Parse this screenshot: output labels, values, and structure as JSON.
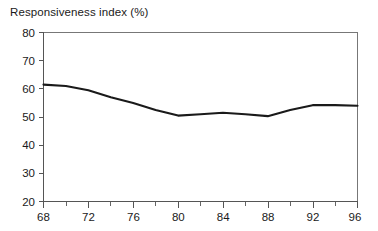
{
  "chart_data": {
    "type": "line",
    "title": "Responsiveness index (%)",
    "xlabel": "",
    "ylabel": "",
    "x": [
      68,
      70,
      72,
      74,
      76,
      78,
      80,
      82,
      84,
      86,
      88,
      90,
      92,
      94,
      96
    ],
    "values": [
      61.5,
      61,
      59.5,
      57,
      55,
      52.5,
      50.5,
      51,
      51.5,
      51,
      50.3,
      52.5,
      54.2,
      54.2,
      54
    ],
    "series": [
      {
        "name": "Responsiveness index",
        "values": [
          61.5,
          61,
          59.5,
          57,
          55,
          52.5,
          50.5,
          51,
          51.5,
          51,
          50.3,
          52.5,
          54.2,
          54.2,
          54
        ],
        "color": "#1a1a1a"
      }
    ],
    "xlim": [
      68,
      96
    ],
    "ylim": [
      20,
      80
    ],
    "xticks": [
      68,
      72,
      76,
      80,
      84,
      88,
      92,
      96
    ],
    "xtick_labels": [
      "68",
      "72",
      "76",
      "80",
      "84",
      "88",
      "92",
      "96"
    ],
    "xminor_ticks": [
      70,
      74,
      78,
      82,
      86,
      90,
      94
    ],
    "yticks": [
      20,
      30,
      40,
      50,
      60,
      70,
      80
    ],
    "ytick_labels": [
      "20",
      "30",
      "40",
      "50",
      "60",
      "70",
      "80"
    ],
    "grid": false,
    "legend": "none",
    "line_color": "#1a1a1a",
    "axis_color": "#555555",
    "background": "#ffffff"
  }
}
